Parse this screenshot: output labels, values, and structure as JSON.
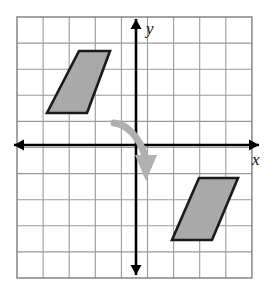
{
  "figure": {
    "background_color": "#ffffff"
  },
  "grid": {
    "name": "coordinate-grid",
    "left": 17,
    "top": 17,
    "cell_size": 26.1,
    "columns": 9,
    "rows": 10,
    "line_color": "#9a9a9a",
    "border_color": "#7d7d7d",
    "line_width": 1.1,
    "border_width": 1.4
  },
  "axes": {
    "origin_x": 136,
    "origin_y": 145,
    "color": "#000000",
    "line_width": 2.6,
    "x_axis": {
      "name": "x-axis",
      "label": "x",
      "label_x": 252,
      "label_y": 165,
      "start_x": 14,
      "end_x": 259
    },
    "y_axis": {
      "name": "y-axis",
      "label": "y",
      "label_x": 146,
      "label_y": 34,
      "start_y": 19,
      "end_y": 275
    }
  },
  "shapes": {
    "fill_color": "#a9a9a9",
    "stroke_color": "#1a1a1a",
    "stroke_width": 2.6,
    "preimage": {
      "name": "preimage-parallelogram",
      "label": "preimage parallelogram (upper left quadrant)",
      "points": "79,51 110,51 87,113 47,113",
      "vertices_px": [
        [
          79,
          51
        ],
        [
          110,
          51
        ],
        [
          87,
          113
        ],
        [
          47,
          113
        ]
      ],
      "vertices_grid": [
        [
          -2,
          3.6
        ],
        [
          -1,
          3.6
        ],
        [
          -1.9,
          1.2
        ],
        [
          -3.4,
          1.2
        ]
      ]
    },
    "image": {
      "name": "image-parallelogram",
      "label": "image parallelogram (lower right quadrant)",
      "points": "199,178 238,178 212,240 172,240",
      "vertices_px": [
        [
          199,
          178
        ],
        [
          238,
          178
        ],
        [
          212,
          240
        ],
        [
          172,
          240
        ]
      ],
      "vertices_grid": [
        [
          2.4,
          -1.3
        ],
        [
          3.9,
          -1.3
        ],
        [
          2.9,
          -3.6
        ],
        [
          1.4,
          -3.6
        ]
      ]
    }
  },
  "rotation_arrow": {
    "name": "rotation-arrow",
    "label": "curved rotation arrow (clockwise)",
    "color": "#b0b0b0",
    "stroke_width": 7,
    "path": "M 114,123 C 126,124 139,136 145,156",
    "head_points": "135,155 157,155 146,181"
  }
}
